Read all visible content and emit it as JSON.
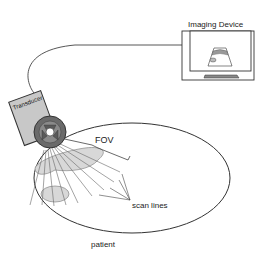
{
  "labels": {
    "device": "Imaging Device",
    "transducer": "Transducer",
    "fov": "FOV",
    "scan_lines": "scan lines",
    "patient": "patient"
  },
  "colors": {
    "stroke": "#333333",
    "transducer_fill": "#c8c8c8",
    "wheel_fill": "#6a6a6a",
    "organ_fill": "#d8d8d8",
    "background": "#ffffff"
  }
}
